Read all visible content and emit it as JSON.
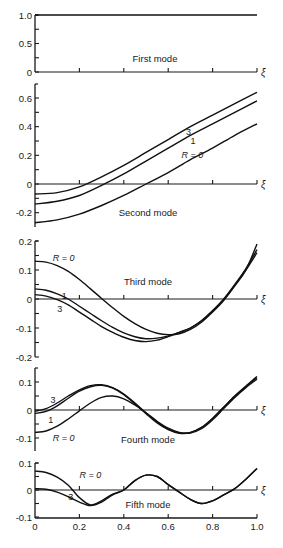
{
  "chart_data": [
    {
      "type": "line",
      "title": "First mode",
      "xlabel": "ξ",
      "xlim": [
        0,
        1.0
      ],
      "ylim": [
        0,
        1.0
      ],
      "yticks": [
        0,
        0.5,
        1.0
      ],
      "ytick_labels": [
        "0",
        "0.5",
        "1.0"
      ],
      "pixel": {
        "top": 15,
        "zero": 72,
        "bottom": 72,
        "ymax": 1.0,
        "ymin": 0
      },
      "title_pos": [
        155,
        62
      ],
      "series": [
        {
          "name": "all R",
          "x": [
            0,
            1.0
          ],
          "y": [
            1.0,
            1.0
          ]
        }
      ],
      "labels": []
    },
    {
      "type": "line",
      "title": "Second mode",
      "xlabel": "ξ",
      "xlim": [
        0,
        1.0
      ],
      "ylim": [
        -0.25,
        0.65
      ],
      "yticks": [
        -0.2,
        0,
        0.2,
        0.4,
        0.6
      ],
      "ytick_labels": [
        "-0.2",
        "0",
        "0.2",
        "0.4",
        "0.6"
      ],
      "pixel": {
        "top": 84,
        "zero": 184,
        "bottom": 227,
        "ymax": 0.6,
        "ymaxpx": 98
      },
      "title_pos": [
        148,
        216
      ],
      "series": [
        {
          "name": "R=3",
          "x": [
            0,
            0.1,
            0.2,
            0.3,
            0.4,
            0.5,
            0.6,
            0.7,
            0.8,
            0.9,
            1.0
          ],
          "y": [
            -0.07,
            -0.06,
            -0.02,
            0.05,
            0.13,
            0.22,
            0.31,
            0.4,
            0.48,
            0.56,
            0.64
          ]
        },
        {
          "name": "R=1",
          "x": [
            0,
            0.1,
            0.2,
            0.3,
            0.4,
            0.5,
            0.6,
            0.7,
            0.8,
            0.9,
            1.0
          ],
          "y": [
            -0.14,
            -0.12,
            -0.08,
            -0.01,
            0.07,
            0.16,
            0.25,
            0.34,
            0.42,
            0.5,
            0.58
          ]
        },
        {
          "name": "R=0",
          "x": [
            0,
            0.1,
            0.2,
            0.3,
            0.4,
            0.5,
            0.6,
            0.7,
            0.8,
            0.9,
            1.0
          ],
          "y": [
            -0.27,
            -0.25,
            -0.21,
            -0.15,
            -0.08,
            0.0,
            0.08,
            0.17,
            0.25,
            0.34,
            0.42
          ]
        }
      ],
      "labels": [
        {
          "text": "3",
          "x": 0.68,
          "y": 0.36
        },
        {
          "text": "1",
          "x": 0.7,
          "y": 0.3
        },
        {
          "text": "R = 0",
          "x": 0.66,
          "y": 0.2
        }
      ]
    },
    {
      "type": "line",
      "title": "Third mode",
      "xlabel": "ξ",
      "xlim": [
        0,
        1.0
      ],
      "ylim": [
        -0.2,
        0.2
      ],
      "yticks": [
        -0.2,
        -0.1,
        0,
        0.1,
        0.2
      ],
      "ytick_labels": [
        "-0.2",
        "-0.1",
        "0",
        "0.1",
        "0.2"
      ],
      "pixel": {
        "top": 241,
        "zero": 299,
        "bottom": 357,
        "ymax": 0.2,
        "ymaxpx": 241
      },
      "title_pos": [
        148,
        285
      ],
      "series": [
        {
          "name": "R=0",
          "x": [
            0,
            0.05,
            0.1,
            0.15,
            0.2,
            0.25,
            0.3,
            0.35,
            0.4,
            0.45,
            0.5,
            0.55,
            0.6,
            0.65,
            0.7,
            0.75,
            0.8,
            0.85,
            0.9,
            0.95,
            1.0
          ],
          "y": [
            0.13,
            0.127,
            0.115,
            0.095,
            0.067,
            0.035,
            0.002,
            -0.03,
            -0.06,
            -0.085,
            -0.105,
            -0.118,
            -0.123,
            -0.12,
            -0.105,
            -0.08,
            -0.045,
            -0.005,
            0.045,
            0.1,
            0.19
          ]
        },
        {
          "name": "R=1",
          "x": [
            0,
            0.05,
            0.1,
            0.15,
            0.2,
            0.25,
            0.3,
            0.35,
            0.4,
            0.45,
            0.5,
            0.55,
            0.6,
            0.65,
            0.7,
            0.75,
            0.8,
            0.85,
            0.9,
            0.95,
            1.0
          ],
          "y": [
            0.035,
            0.03,
            0.018,
            0.0,
            -0.025,
            -0.05,
            -0.075,
            -0.098,
            -0.117,
            -0.13,
            -0.137,
            -0.135,
            -0.127,
            -0.115,
            -0.1,
            -0.075,
            -0.04,
            0.0,
            0.05,
            0.105,
            0.17
          ]
        },
        {
          "name": "R=3",
          "x": [
            0,
            0.05,
            0.1,
            0.15,
            0.2,
            0.25,
            0.3,
            0.35,
            0.4,
            0.45,
            0.5,
            0.55,
            0.6,
            0.65,
            0.7,
            0.75,
            0.8,
            0.85,
            0.9,
            0.95,
            1.0
          ],
          "y": [
            0.015,
            0.01,
            -0.002,
            -0.02,
            -0.045,
            -0.07,
            -0.095,
            -0.115,
            -0.132,
            -0.143,
            -0.147,
            -0.142,
            -0.13,
            -0.115,
            -0.1,
            -0.075,
            -0.042,
            -0.002,
            0.048,
            0.1,
            0.16
          ]
        }
      ],
      "labels": [
        {
          "text": "R = 0",
          "x": 0.08,
          "y": 0.14
        },
        {
          "text": "1",
          "x": 0.12,
          "y": 0.01
        },
        {
          "text": "3",
          "x": 0.1,
          "y": -0.035
        }
      ]
    },
    {
      "type": "line",
      "title": "Fourth mode",
      "xlabel": "ξ",
      "xlim": [
        0,
        1.0
      ],
      "ylim": [
        -0.15,
        0.15
      ],
      "yticks": [
        -0.1,
        0,
        0.1
      ],
      "ytick_labels": [
        "-0.1",
        "0",
        "0.1"
      ],
      "pixel": {
        "top": 368,
        "zero": 410,
        "bottom": 451,
        "ymax": 0.1,
        "ymaxpx": 382
      },
      "title_pos": [
        148,
        443
      ],
      "series": [
        {
          "name": "R=3",
          "x": [
            0,
            0.05,
            0.1,
            0.15,
            0.2,
            0.25,
            0.3,
            0.35,
            0.4,
            0.45,
            0.5,
            0.55,
            0.6,
            0.65,
            0.7,
            0.75,
            0.8,
            0.85,
            0.9,
            0.95,
            1.0
          ],
          "y": [
            -0.005,
            0.005,
            0.025,
            0.05,
            0.072,
            0.087,
            0.09,
            0.08,
            0.057,
            0.025,
            -0.01,
            -0.043,
            -0.068,
            -0.082,
            -0.08,
            -0.062,
            -0.03,
            0.01,
            0.05,
            0.085,
            0.12
          ]
        },
        {
          "name": "R=1",
          "x": [
            0,
            0.05,
            0.1,
            0.15,
            0.2,
            0.25,
            0.3,
            0.35,
            0.4,
            0.45,
            0.5,
            0.55,
            0.6,
            0.65,
            0.7,
            0.75,
            0.8,
            0.85,
            0.9,
            0.95,
            1.0
          ],
          "y": [
            -0.012,
            -0.005,
            0.015,
            0.042,
            0.067,
            0.083,
            0.088,
            0.078,
            0.055,
            0.022,
            -0.013,
            -0.046,
            -0.07,
            -0.083,
            -0.081,
            -0.063,
            -0.03,
            0.01,
            0.05,
            0.085,
            0.115
          ]
        },
        {
          "name": "R=0",
          "x": [
            0,
            0.05,
            0.1,
            0.15,
            0.2,
            0.25,
            0.3,
            0.35,
            0.4,
            0.45,
            0.5,
            0.55,
            0.6,
            0.65,
            0.7,
            0.75,
            0.8,
            0.85,
            0.9,
            0.95,
            1.0
          ],
          "y": [
            -0.08,
            -0.075,
            -0.058,
            -0.032,
            -0.003,
            0.025,
            0.045,
            0.05,
            0.04,
            0.018,
            -0.01,
            -0.04,
            -0.065,
            -0.08,
            -0.082,
            -0.067,
            -0.035,
            0.005,
            0.045,
            0.08,
            0.11
          ]
        }
      ],
      "labels": [
        {
          "text": "3",
          "x": 0.07,
          "y": 0.035
        },
        {
          "text": "1",
          "x": 0.06,
          "y": -0.035
        },
        {
          "text": "R = 0",
          "x": 0.08,
          "y": -0.1
        }
      ]
    },
    {
      "type": "line",
      "title": "Fifth mode",
      "xlabel": "ξ",
      "xlim": [
        0,
        1.0
      ],
      "ylim": [
        -0.1,
        0.1
      ],
      "yticks": [
        -0.1,
        0,
        0.1
      ],
      "ytick_labels": [
        "-0.1",
        "0",
        "0.1"
      ],
      "xticks": [
        0,
        0.2,
        0.4,
        0.6,
        0.8,
        1.0
      ],
      "xtick_labels": [
        "0",
        "0.2",
        "0.4",
        "0.6",
        "0.8",
        "1.0"
      ],
      "pixel": {
        "top": 463,
        "zero": 490,
        "bottom": 518,
        "ymax": 0.1,
        "ymaxpx": 463
      },
      "title_pos": [
        148,
        508
      ],
      "series": [
        {
          "name": "R=0",
          "x": [
            0,
            0.05,
            0.1,
            0.15,
            0.2,
            0.25,
            0.3,
            0.35,
            0.4,
            0.45,
            0.5,
            0.55,
            0.6,
            0.65,
            0.7,
            0.75,
            0.8,
            0.85,
            0.9,
            0.95,
            1.0
          ],
          "y": [
            0.07,
            0.065,
            0.048,
            0.018,
            -0.028,
            -0.055,
            -0.04,
            -0.015,
            0.0,
            0.035,
            0.055,
            0.05,
            0.02,
            -0.008,
            -0.035,
            -0.05,
            -0.04,
            -0.018,
            0.005,
            0.04,
            0.08
          ]
        },
        {
          "name": "R=3",
          "x": [
            0,
            0.05,
            0.1,
            0.15,
            0.2,
            0.25,
            0.3,
            0.35,
            0.4,
            0.45,
            0.5,
            0.55,
            0.6,
            0.65,
            0.7,
            0.75,
            0.8,
            0.85,
            0.9,
            0.95,
            1.0
          ],
          "y": [
            0.005,
            0.003,
            -0.008,
            -0.025,
            -0.045,
            -0.058,
            -0.045,
            -0.018,
            0.0,
            0.035,
            0.055,
            0.05,
            0.02,
            -0.008,
            -0.035,
            -0.05,
            -0.04,
            -0.018,
            0.005,
            0.04,
            0.08
          ]
        }
      ],
      "labels": [
        {
          "text": "R = 0",
          "x": 0.2,
          "y": 0.055
        },
        {
          "text": "3",
          "x": 0.15,
          "y": -0.025
        }
      ]
    }
  ],
  "axis": {
    "x_symbol": "ξ",
    "x_left_px": 35,
    "x_right_px": 257,
    "minor_xticks": [
      0.2,
      0.4,
      0.6,
      0.8,
      1.0
    ]
  }
}
